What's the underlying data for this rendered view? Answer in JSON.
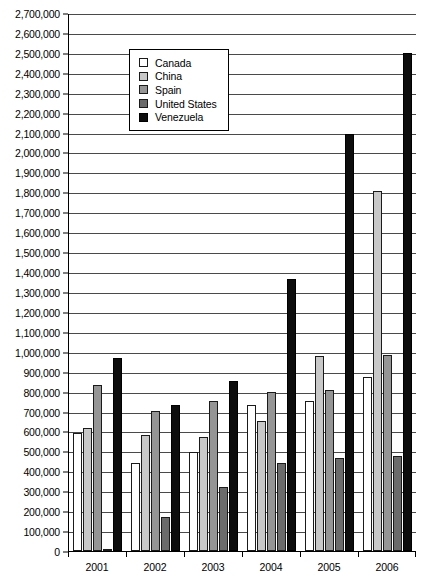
{
  "chart_data": {
    "type": "bar",
    "title": "",
    "subtitle": "",
    "xlabel": "",
    "ylabel": "",
    "categories": [
      "2001",
      "2002",
      "2003",
      "2004",
      "2005",
      "2006"
    ],
    "series": [
      {
        "name": "Canada",
        "color": "#ffffff",
        "values": [
          590000,
          440000,
          495000,
          735000,
          755000,
          875000
        ]
      },
      {
        "name": "China",
        "color": "#c8c8c8",
        "values": [
          615000,
          580000,
          570000,
          650000,
          980000,
          1805000
        ]
      },
      {
        "name": "Spain",
        "color": "#959595",
        "values": [
          832000,
          705000,
          753000,
          800000,
          807000,
          985000
        ]
      },
      {
        "name": "United States",
        "color": "#6b6b6b",
        "values": [
          5000,
          170000,
          320000,
          440000,
          465000,
          475000
        ]
      },
      {
        "name": "Venezuela",
        "color": "#0d0d0d",
        "values": [
          970000,
          735000,
          855000,
          1365000,
          2095000,
          2500000
        ]
      }
    ],
    "ylim": [
      0,
      2700000
    ],
    "ytick_step": 100000,
    "yticks": [
      "2,700,000",
      "2,600,000",
      "2,500,000",
      "2,400,000",
      "2,300,000",
      "2,200,000",
      "2,100,000",
      "2,000,000",
      "1,900,000",
      "1,800,000",
      "1,700,000",
      "1,600,000",
      "1,500,000",
      "1,400,000",
      "1,300,000",
      "1,200,000",
      "1,100,000",
      "1,000,000",
      "900,000",
      "800,000",
      "700,000",
      "600,000",
      "500,000",
      "400,000",
      "300,000",
      "200,000",
      "100,000",
      "0"
    ],
    "ytick_values": [
      2700000,
      2600000,
      2500000,
      2400000,
      2300000,
      2200000,
      2100000,
      2000000,
      1900000,
      1800000,
      1700000,
      1600000,
      1500000,
      1400000,
      1300000,
      1200000,
      1100000,
      1000000,
      900000,
      800000,
      700000,
      600000,
      500000,
      400000,
      300000,
      200000,
      100000,
      0
    ],
    "grid": true,
    "legend_position": "upper-left-inset",
    "legend_entries": [
      "Canada",
      "China",
      "Spain",
      "United States",
      "Venezuela"
    ]
  }
}
